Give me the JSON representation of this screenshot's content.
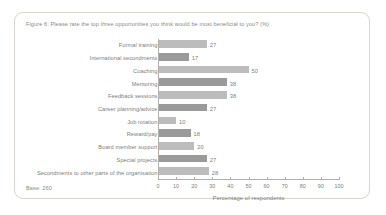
{
  "figure": {
    "title": "Figure 6: Please rate the top three opportunities you think would be most beneficial to you? (%)",
    "base_note": "Base: 260"
  },
  "chart_data": {
    "type": "bar",
    "orientation": "horizontal",
    "title": "Figure 6: Please rate the top three opportunities you think would be most beneficial to you? (%)",
    "xlabel": "Percentage of respondents",
    "ylabel": "",
    "xlim": [
      0,
      100
    ],
    "xticks": [
      0,
      10,
      20,
      30,
      40,
      50,
      60,
      70,
      80,
      90,
      100
    ],
    "grid": false,
    "legend": null,
    "categories": [
      "Formal training",
      "International secondments",
      "Coaching",
      "Mentoring",
      "Feedback sessions",
      "Career planning/advice",
      "Job rotation",
      "Reward/pay",
      "Board member support",
      "Special projects",
      "Secondments to other parts of the organisation"
    ],
    "values": [
      27,
      17,
      50,
      38,
      38,
      27,
      10,
      18,
      20,
      27,
      28
    ],
    "value_labels": [
      "27",
      "17",
      "50",
      "38",
      "38",
      "27",
      "10",
      "18",
      "20",
      "27",
      "28"
    ],
    "bar_shades": [
      "light",
      "dark",
      "light",
      "dark",
      "light",
      "dark",
      "light",
      "dark",
      "light",
      "dark",
      "light"
    ],
    "colors": {
      "bar_light": "#bcbcbc",
      "bar_dark": "#9a9a9a",
      "axis": "#b3b0ac",
      "text": "#7d7d7d",
      "card_border": "#d8d4cf",
      "background": "#ffffff"
    }
  }
}
